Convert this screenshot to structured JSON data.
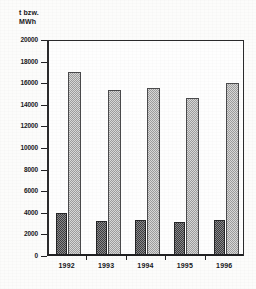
{
  "axis_unit_caption": "t bzw.\nMWh",
  "chart_data": {
    "type": "bar",
    "title": "",
    "subtitle": "",
    "xlabel": "",
    "ylabel": "t bzw. MWh",
    "categories": [
      "1992",
      "1993",
      "1994",
      "1995",
      "1996"
    ],
    "series": [
      {
        "name": "dark-series",
        "values": [
          3900,
          3150,
          3200,
          3050,
          3250
        ],
        "color": "#6e6e70"
      },
      {
        "name": "light-series",
        "values": [
          16900,
          15300,
          15450,
          14550,
          15900
        ],
        "color": "#bdbdbd"
      }
    ],
    "ylim": [
      0,
      20000
    ],
    "ytick_labels": [
      "0",
      "2000",
      "4000",
      "6000",
      "8000",
      "10000",
      "12000",
      "14000",
      "16000",
      "18000",
      "20000"
    ],
    "ytick_values": [
      0,
      2000,
      4000,
      6000,
      8000,
      10000,
      12000,
      14000,
      16000,
      18000,
      20000
    ],
    "grid": false,
    "legend": null,
    "legend_position": "none"
  }
}
